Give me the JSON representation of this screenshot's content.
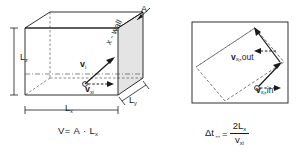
{
  "figure": {
    "domain": "physics-kinetic-theory-diagram",
    "background_color": "#ffffff",
    "line_color": "#1a1a1a",
    "wall_fill_color": "#e3e3e3"
  },
  "left_panel": {
    "name": "gas-container-box",
    "labels": {
      "height": "L",
      "height_sub": "z",
      "length": "L",
      "length_sub": "x",
      "depth": "L",
      "depth_sub": "y",
      "area": "A",
      "wall": "x - wall",
      "velocity_vector": "v",
      "velocity_vector_sub": "i",
      "velocity_component": "v",
      "velocity_component_sub": "x",
      "velocity_component_sub2": "i"
    },
    "formula": {
      "lhs": "V",
      "equals": "=",
      "rhs_area": "A",
      "dot": "·",
      "rhs_length": "L",
      "rhs_length_sub": "x",
      "full_text": "V = A · Lₓ"
    }
  },
  "right_panel": {
    "name": "particle-bounce-box",
    "labels": {
      "v_out": "v",
      "v_out_sub": "x",
      "v_out_sub2": "i",
      "v_out_suffix": ",out",
      "v_in": "v",
      "v_in_sub": "x",
      "v_in_sub2": "i",
      "v_in_suffix": ",in"
    },
    "formula": {
      "delta_t": "Δt",
      "delta_t_sub": "↔",
      "equals": "=",
      "numerator": "2L",
      "numerator_sub": "x",
      "denominator": "v",
      "denominator_sub": "x",
      "denominator_sub2": "i",
      "full_text": "Δt↔ = 2Lₓ / vₓᵢ"
    }
  }
}
